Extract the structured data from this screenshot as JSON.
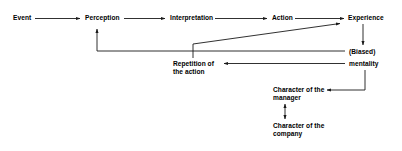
{
  "diagram": {
    "stroke_color": "#1a1a1a",
    "text_color": "#000000",
    "background_color": "#ffffff",
    "nodes": {
      "event": "Event",
      "perception": "Perception",
      "interpretation": "Interpretation",
      "action": "Action",
      "experience": "Experience",
      "biased": "(Biased)",
      "mentality": "mentality",
      "repetition_line1": "Repetition of",
      "repetition_line2": "the action",
      "manager_line1": "Character of the",
      "manager_line2": "manager",
      "company_line1": "Character of the",
      "company_line2": "company"
    },
    "connectors": [
      {
        "name": "event-to-perception",
        "from": "Event",
        "to": "Perception",
        "direction": "right"
      },
      {
        "name": "perception-to-interpretation",
        "from": "Perception",
        "to": "Interpretation",
        "direction": "right"
      },
      {
        "name": "interpretation-to-action",
        "from": "Interpretation",
        "to": "Action",
        "direction": "right"
      },
      {
        "name": "action-to-experience",
        "from": "Action",
        "to": "Experience",
        "direction": "right"
      },
      {
        "name": "repetition-to-experience",
        "from": "Repetition of the action",
        "to": "Experience",
        "direction": "diagonal-up-right"
      },
      {
        "name": "experience-to-mentality",
        "from": "Experience",
        "to": "(Biased) mentality",
        "direction": "down"
      },
      {
        "name": "mentality-to-perception",
        "from": "(Biased) mentality",
        "to": "Perception",
        "direction": "left-then-up"
      },
      {
        "name": "mentality-to-repetition",
        "from": "(Biased) mentality",
        "to": "Repetition of the action",
        "direction": "left"
      },
      {
        "name": "mentality-to-manager",
        "from": "(Biased) mentality",
        "to": "Character of the manager",
        "direction": "down-then-left"
      },
      {
        "name": "company-to-manager",
        "from": "Character of the company",
        "to": "Character of the manager",
        "direction": "up-bidirectional"
      }
    ]
  }
}
